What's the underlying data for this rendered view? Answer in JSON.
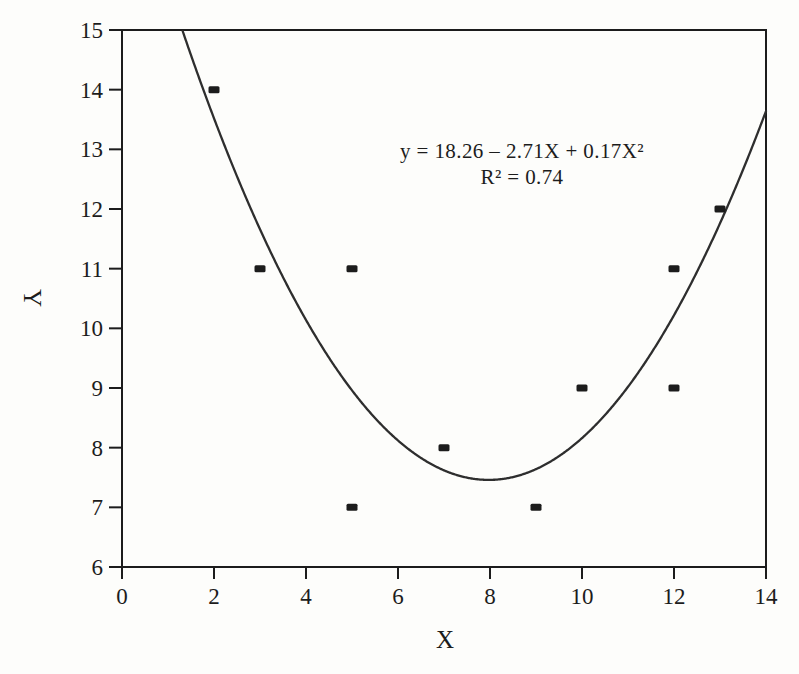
{
  "figure": {
    "background": "#fdfdfb",
    "ink_color": "#1c1c1c",
    "curve_color": "#2e2e2e"
  },
  "chart_data": {
    "type": "scatter",
    "title": "",
    "xlabel": "X",
    "ylabel": "Y",
    "xlim": [
      0,
      14
    ],
    "ylim": [
      6,
      15
    ],
    "xticks": [
      0,
      2,
      4,
      6,
      8,
      10,
      12,
      14
    ],
    "yticks": [
      6,
      7,
      8,
      9,
      10,
      11,
      12,
      13,
      14,
      15
    ],
    "grid": false,
    "frame": "full-box",
    "marker": "filled-square",
    "points": [
      [
        2,
        14
      ],
      [
        3,
        11
      ],
      [
        5,
        11
      ],
      [
        5,
        7
      ],
      [
        7,
        8
      ],
      [
        9,
        7
      ],
      [
        10,
        9
      ],
      [
        12,
        9
      ],
      [
        12,
        11
      ],
      [
        13,
        12
      ]
    ],
    "fit_curve": {
      "type": "quadratic",
      "coefficients": {
        "intercept": 18.26,
        "x": -2.71,
        "x2": 0.17
      },
      "r_squared": 0.74,
      "clip_to_axes": true
    },
    "annotation": {
      "line1": "y = 18.26 – 2.71X + 0.17X²",
      "line2": "R² = 0.74"
    }
  }
}
